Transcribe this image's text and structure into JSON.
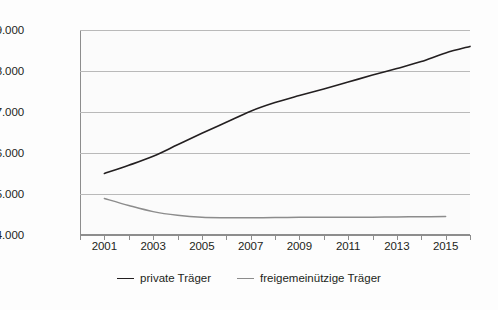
{
  "chart_data": {
    "type": "line",
    "title": "",
    "subtitle": "",
    "xlabel": "",
    "ylabel": "",
    "xlim": [
      2000,
      2016
    ],
    "ylim": [
      4000,
      9000
    ],
    "grid": true,
    "legend_position": "bottom",
    "x": [
      2001,
      2002,
      2003,
      2004,
      2005,
      2006,
      2007,
      2008,
      2009,
      2010,
      2011,
      2012,
      2013,
      2014,
      2015,
      2016
    ],
    "y_ticks": [
      4000,
      5000,
      6000,
      7000,
      8000,
      9000
    ],
    "y_tick_labels": [
      "4.000",
      "5.000",
      "6.000",
      "7.000",
      "8.000",
      "9.000"
    ],
    "x_ticks": [
      2000,
      2001,
      2002,
      2003,
      2004,
      2005,
      2006,
      2007,
      2008,
      2009,
      2010,
      2011,
      2012,
      2013,
      2014,
      2015,
      2016
    ],
    "x_tick_labels": [
      "2001",
      "2003",
      "2005",
      "2007",
      "2009",
      "2011",
      "2013",
      "2015"
    ],
    "x_tick_label_years": [
      2001,
      2003,
      2005,
      2007,
      2009,
      2011,
      2013,
      2015
    ],
    "series": [
      {
        "name": "private Träger",
        "color": "#231f20",
        "values": [
          5500,
          5700,
          5920,
          6200,
          6480,
          6750,
          7020,
          7230,
          7400,
          7560,
          7730,
          7900,
          8060,
          8230,
          8440,
          8600
        ]
      },
      {
        "name": "freigemeinützige Träger",
        "color": "#8c8c8c",
        "values": [
          4890,
          4720,
          4570,
          4480,
          4430,
          4420,
          4420,
          4425,
          4430,
          4430,
          4435,
          4435,
          4440,
          4445,
          4450,
          null
        ]
      }
    ]
  },
  "legend": {
    "entries": [
      {
        "label": "private Träger",
        "color": "#231f20"
      },
      {
        "label": "freigemeinützige Träger",
        "color": "#8c8c8c"
      }
    ]
  }
}
